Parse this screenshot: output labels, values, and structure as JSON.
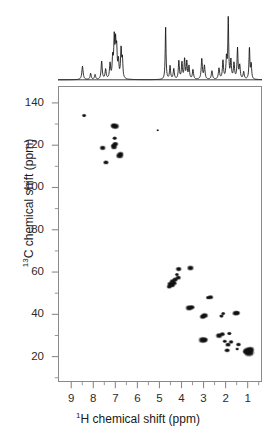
{
  "figure": {
    "name": "2d-hsqc-nmr-spectrum",
    "x_axis_title_pre": "H chemical shift (ppm)",
    "x_axis_title_sup": "1",
    "y_axis_title_pre": "C chemical shift (ppm)",
    "y_axis_title_sup": "13",
    "frame_color": "#8a8a8a",
    "peak_color": "#111111",
    "trace_color": "#111111"
  },
  "chart_data": {
    "type": "scatter",
    "title": "",
    "subtitle": "",
    "xlabel": "1H chemical shift (ppm)",
    "ylabel": "13C chemical shift (ppm)",
    "xlim": [
      9.6,
      0.35
    ],
    "ylim": [
      148,
      8
    ],
    "x_inverted": true,
    "y_inverted": true,
    "grid": false,
    "legend": null,
    "xticks": [
      9,
      8,
      7,
      6,
      5,
      4,
      3,
      2,
      1
    ],
    "xtick_labels": [
      "9",
      "8",
      "7",
      "6",
      "5",
      "4",
      "3",
      "2",
      "1"
    ],
    "x_minor_ticks": [
      8.5,
      7.5,
      6.5,
      5.5,
      4.5,
      3.5,
      2.5,
      1.5,
      0.5
    ],
    "yticks": [
      20,
      40,
      60,
      80,
      100,
      120,
      140
    ],
    "ytick_labels": [
      "20",
      "40",
      "60",
      "80",
      "100",
      "120",
      "140"
    ],
    "y_minor_ticks": [
      10,
      30,
      50,
      70,
      90,
      110,
      130
    ],
    "series": [
      {
        "name": "HSQC cross peaks",
        "points": [
          {
            "x": 0.9,
            "y": 21.6,
            "r": 4.6
          },
          {
            "x": 0.95,
            "y": 22.4,
            "r": 4.0
          },
          {
            "x": 0.83,
            "y": 23.0,
            "r": 3.2
          },
          {
            "x": 1.03,
            "y": 22.0,
            "r": 3.0
          },
          {
            "x": 1.44,
            "y": 23.2,
            "r": 1.6
          },
          {
            "x": 1.9,
            "y": 22.6,
            "r": 2.4
          },
          {
            "x": 1.86,
            "y": 25.3,
            "r": 2.4
          },
          {
            "x": 1.72,
            "y": 26.6,
            "r": 2.1
          },
          {
            "x": 2.01,
            "y": 26.9,
            "r": 1.9
          },
          {
            "x": 1.38,
            "y": 25.4,
            "r": 2.2
          },
          {
            "x": 2.27,
            "y": 29.6,
            "r": 2.9
          },
          {
            "x": 2.12,
            "y": 30.3,
            "r": 2.3
          },
          {
            "x": 1.8,
            "y": 30.6,
            "r": 2.0
          },
          {
            "x": 3.02,
            "y": 27.5,
            "r": 3.6
          },
          {
            "x": 2.92,
            "y": 27.6,
            "r": 2.8
          },
          {
            "x": 2.16,
            "y": 38.9,
            "r": 2.0
          },
          {
            "x": 2.08,
            "y": 40.1,
            "r": 1.8
          },
          {
            "x": 1.51,
            "y": 40.3,
            "r": 2.9
          },
          {
            "x": 1.43,
            "y": 40.4,
            "r": 2.4
          },
          {
            "x": 3.02,
            "y": 38.6,
            "r": 2.7
          },
          {
            "x": 2.93,
            "y": 39.2,
            "r": 3.0
          },
          {
            "x": 3.64,
            "y": 42.8,
            "r": 3.1
          },
          {
            "x": 3.52,
            "y": 43.1,
            "r": 2.6
          },
          {
            "x": 2.66,
            "y": 47.9,
            "r": 2.4
          },
          {
            "x": 2.77,
            "y": 47.7,
            "r": 2.0
          },
          {
            "x": 4.42,
            "y": 53.6,
            "r": 2.6
          },
          {
            "x": 4.5,
            "y": 54.2,
            "r": 2.8
          },
          {
            "x": 4.33,
            "y": 54.6,
            "r": 2.4
          },
          {
            "x": 4.4,
            "y": 55.4,
            "r": 2.7
          },
          {
            "x": 4.55,
            "y": 52.9,
            "r": 2.3
          },
          {
            "x": 4.28,
            "y": 56.3,
            "r": 2.5
          },
          {
            "x": 4.14,
            "y": 57.2,
            "r": 2.4
          },
          {
            "x": 4.2,
            "y": 58.7,
            "r": 1.8
          },
          {
            "x": 4.12,
            "y": 61.3,
            "r": 2.6
          },
          {
            "x": 3.58,
            "y": 61.8,
            "r": 2.9
          },
          {
            "x": 7.45,
            "y": 112.1,
            "r": 2.4
          },
          {
            "x": 6.82,
            "y": 115.3,
            "r": 3.2
          },
          {
            "x": 6.78,
            "y": 116.1,
            "r": 2.6
          },
          {
            "x": 7.6,
            "y": 119.0,
            "r": 2.6
          },
          {
            "x": 7.08,
            "y": 119.4,
            "r": 2.8
          },
          {
            "x": 7.02,
            "y": 120.8,
            "r": 2.7
          },
          {
            "x": 7.11,
            "y": 120.1,
            "r": 2.2
          },
          {
            "x": 7.05,
            "y": 123.6,
            "r": 2.0
          },
          {
            "x": 7.02,
            "y": 129.3,
            "r": 3.3
          },
          {
            "x": 7.1,
            "y": 129.6,
            "r": 2.8
          },
          {
            "x": 5.08,
            "y": 127.4,
            "r": 1.1
          },
          {
            "x": 8.45,
            "y": 134.4,
            "r": 1.9
          }
        ]
      }
    ],
    "projection_1d": {
      "axis": "top",
      "name": "1H 1D projection",
      "baseline_level": 0.0,
      "peaks": [
        {
          "x": 8.49,
          "h": 0.22,
          "w": 0.035
        },
        {
          "x": 8.12,
          "h": 0.1,
          "w": 0.03
        },
        {
          "x": 7.92,
          "h": 0.08,
          "w": 0.03
        },
        {
          "x": 7.62,
          "h": 0.3,
          "w": 0.03
        },
        {
          "x": 7.44,
          "h": 0.16,
          "w": 0.03
        },
        {
          "x": 7.24,
          "h": 0.25,
          "w": 0.03
        },
        {
          "x": 7.12,
          "h": 0.33,
          "w": 0.028
        },
        {
          "x": 7.05,
          "h": 0.62,
          "w": 0.026
        },
        {
          "x": 6.99,
          "h": 0.52,
          "w": 0.026
        },
        {
          "x": 6.94,
          "h": 0.45,
          "w": 0.026
        },
        {
          "x": 6.86,
          "h": 0.28,
          "w": 0.028
        },
        {
          "x": 6.74,
          "h": 0.48,
          "w": 0.028
        },
        {
          "x": 6.68,
          "h": 0.3,
          "w": 0.026
        },
        {
          "x": 4.72,
          "h": 0.86,
          "w": 0.022
        },
        {
          "x": 4.52,
          "h": 0.22,
          "w": 0.028
        },
        {
          "x": 4.35,
          "h": 0.17,
          "w": 0.03
        },
        {
          "x": 4.12,
          "h": 0.3,
          "w": 0.028
        },
        {
          "x": 3.98,
          "h": 0.27,
          "w": 0.028
        },
        {
          "x": 3.86,
          "h": 0.33,
          "w": 0.026
        },
        {
          "x": 3.76,
          "h": 0.28,
          "w": 0.026
        },
        {
          "x": 3.66,
          "h": 0.21,
          "w": 0.028
        },
        {
          "x": 3.48,
          "h": 0.16,
          "w": 0.03
        },
        {
          "x": 3.08,
          "h": 0.34,
          "w": 0.03
        },
        {
          "x": 2.96,
          "h": 0.22,
          "w": 0.03
        },
        {
          "x": 2.62,
          "h": 0.14,
          "w": 0.032
        },
        {
          "x": 2.3,
          "h": 0.18,
          "w": 0.032
        },
        {
          "x": 2.12,
          "h": 0.3,
          "w": 0.03
        },
        {
          "x": 1.96,
          "h": 0.34,
          "w": 0.028
        },
        {
          "x": 1.88,
          "h": 1.0,
          "w": 0.022
        },
        {
          "x": 1.76,
          "h": 0.3,
          "w": 0.028
        },
        {
          "x": 1.62,
          "h": 0.26,
          "w": 0.03
        },
        {
          "x": 1.46,
          "h": 0.5,
          "w": 0.026
        },
        {
          "x": 1.36,
          "h": 0.22,
          "w": 0.03
        },
        {
          "x": 1.18,
          "h": 0.12,
          "w": 0.03
        },
        {
          "x": 0.92,
          "h": 0.52,
          "w": 0.024
        },
        {
          "x": 0.84,
          "h": 0.24,
          "w": 0.026
        }
      ]
    }
  }
}
